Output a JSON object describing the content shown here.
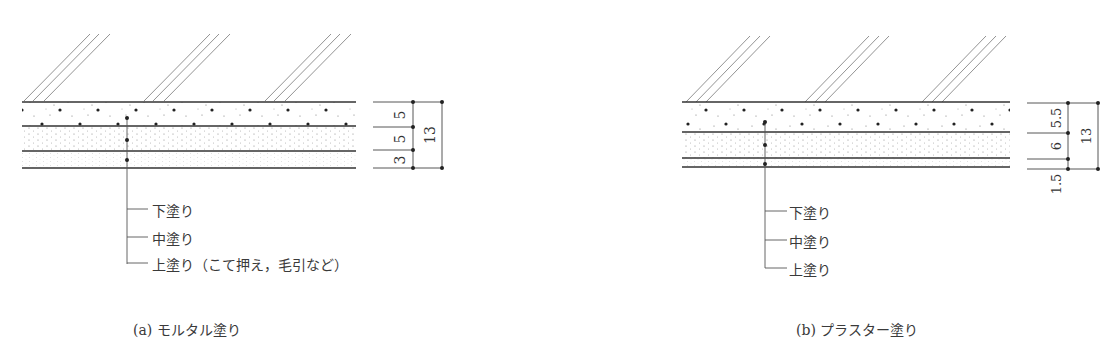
{
  "figure_a": {
    "caption": "(a) モルタル塗り",
    "layers": [
      {
        "name": "上塗り",
        "thickness_label": "5"
      },
      {
        "name": "中塗り",
        "thickness_label": "5"
      },
      {
        "name": "下塗り",
        "thickness_label": "3"
      }
    ],
    "total_label": "13",
    "leader_labels": [
      "下塗り",
      "中塗り",
      "上塗り（こて押え，毛引など）"
    ]
  },
  "figure_b": {
    "caption": "(b) プラスター塗り",
    "layers": [
      {
        "name": "上塗り",
        "thickness_label": "5.5"
      },
      {
        "name": "中塗り",
        "thickness_label": "6"
      },
      {
        "name": "下塗り",
        "thickness_label": "1.5"
      }
    ],
    "total_label": "13",
    "leader_labels": [
      "下塗り",
      "中塗り",
      "上塗り"
    ]
  },
  "colors": {
    "line": "#333333",
    "hatch": "#777777",
    "dot": "#222222"
  }
}
